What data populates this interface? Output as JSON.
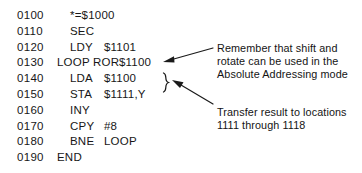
{
  "listing": {
    "rows": [
      {
        "line": "0100",
        "label": "",
        "mnemonic": "*=$1000",
        "operand": ""
      },
      {
        "line": "0110",
        "label": "",
        "mnemonic": "SEC",
        "operand": ""
      },
      {
        "line": "0120",
        "label": "",
        "mnemonic": "LDY",
        "operand": "$1101"
      },
      {
        "line": "0130",
        "label": "LOOP",
        "mnemonic": "ROR",
        "operand": "$1100"
      },
      {
        "line": "0140",
        "label": "",
        "mnemonic": "LDA",
        "operand": "$1100"
      },
      {
        "line": "0150",
        "label": "",
        "mnemonic": "STA",
        "operand": "$1111,Y"
      },
      {
        "line": "0160",
        "label": "",
        "mnemonic": "INY",
        "operand": ""
      },
      {
        "line": "0170",
        "label": "",
        "mnemonic": "CPY",
        "operand": "#8"
      },
      {
        "line": "0180",
        "label": "",
        "mnemonic": "BNE",
        "operand": "LOOP"
      },
      {
        "line": "0190",
        "label": "",
        "mnemonic": "END",
        "operand": ""
      }
    ]
  },
  "annotations": {
    "shift_rotate": {
      "lines": [
        "Remember that shift and",
        "rotate can be used in the",
        "Absolute Addressing mode"
      ]
    },
    "transfer": {
      "lines": [
        "Transfer result to locations",
        "1111 through 1118"
      ]
    }
  },
  "colors": {
    "ink": "#171717",
    "background": "#ffffff"
  }
}
